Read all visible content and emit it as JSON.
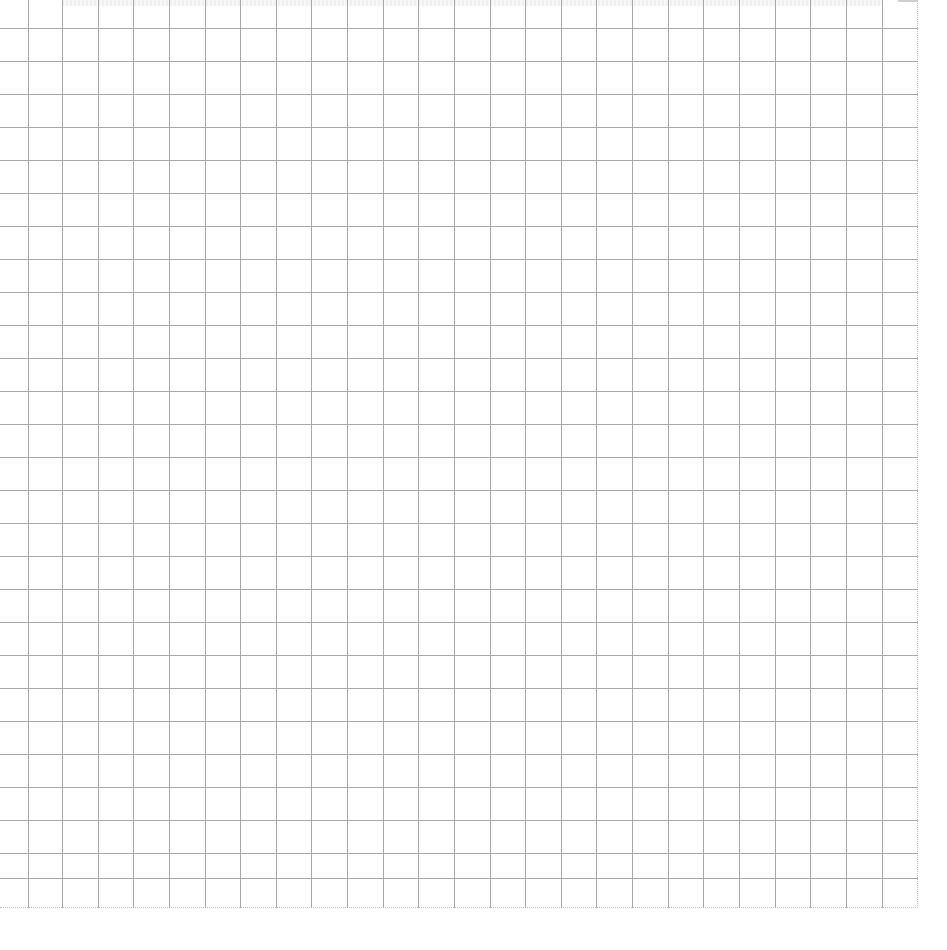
{
  "sheet": {
    "type": "blank grid paper",
    "line_color": "#a8a8a8",
    "background_color": "#ffffff",
    "border_style": "dotted",
    "border_color": "#bdbdbd",
    "width": 918,
    "height": 908,
    "vertical_line_positions": [
      28,
      62,
      98,
      133,
      169,
      205,
      240,
      276,
      311,
      347,
      383,
      418,
      454,
      490,
      525,
      561,
      596,
      632,
      668,
      703,
      739,
      775,
      810,
      846,
      882
    ],
    "horizontal_line_positions": [
      28,
      61,
      94,
      127,
      160,
      193,
      226,
      259,
      292,
      325,
      358,
      391,
      424,
      457,
      490,
      523,
      556,
      589,
      622,
      655,
      688,
      721,
      754,
      787,
      820,
      853,
      878
    ]
  }
}
